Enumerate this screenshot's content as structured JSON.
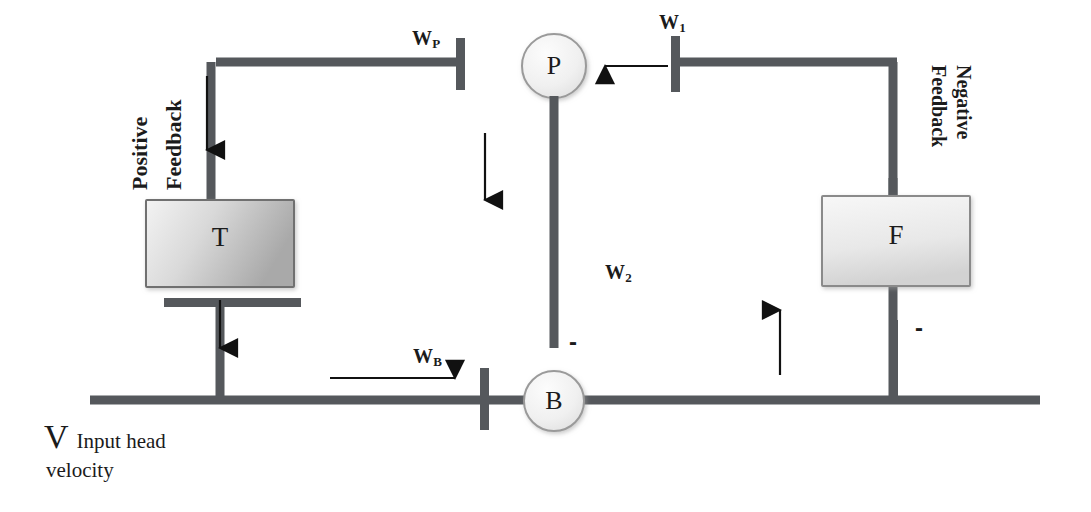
{
  "diagram": {
    "colors": {
      "line": "#55585c",
      "thin_arrow": "#111111",
      "box_fill_light": "#efefef",
      "box_fill_dark": "#b9b9b9",
      "box_stroke": "#8a8a8a",
      "circle_fill": "#f2f2f2",
      "circle_stroke": "#9a9a9a",
      "text": "#1b1b1b",
      "background": "#ffffff"
    },
    "nodes": [
      {
        "id": "T",
        "shape": "rect",
        "label": "T"
      },
      {
        "id": "F",
        "shape": "rect",
        "label": "F"
      },
      {
        "id": "P",
        "shape": "circle",
        "label": "P"
      },
      {
        "id": "B",
        "shape": "circle",
        "label": "B"
      }
    ],
    "signal_labels": [
      {
        "id": "wp",
        "base": "W",
        "sub": "P"
      },
      {
        "id": "w1",
        "base": "W",
        "sub": "1"
      },
      {
        "id": "w2",
        "base": "W",
        "sub": "2"
      },
      {
        "id": "wb",
        "base": "W",
        "sub": "B"
      }
    ],
    "annotations": {
      "positive_feedback_line1": "Positive",
      "positive_feedback_line2": "Feedback",
      "negative_feedback_line1": "Negative",
      "negative_feedback_line2": "Feedback",
      "minus_1": "-",
      "minus_2": "-"
    },
    "caption": {
      "symbol": "V",
      "text_line1": "Input head",
      "text_line2": "velocity"
    }
  }
}
